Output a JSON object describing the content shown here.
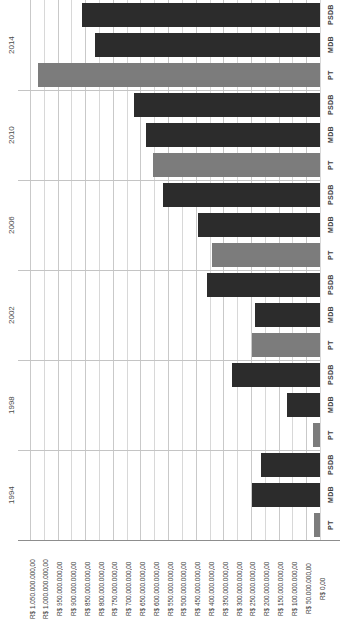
{
  "chart_data": {
    "type": "bar",
    "orientation": "horizontal",
    "title": "",
    "subtitle": "",
    "xlabel": "",
    "ylabel": "",
    "x_axis_reversed": true,
    "grid": true,
    "legend_position": "none",
    "xlim": [
      0,
      1050000000000
    ],
    "currency_prefix": "R$",
    "tick_labels": [
      "R$ 1.050.000.000,00",
      "R$ 1.000.000.000,00",
      "R$ 950.000.000,00",
      "R$ 900.000.000,00",
      "R$ 850.000.000,00",
      "R$ 800.000.000,00",
      "R$ 750.000.000,00",
      "R$ 700.000.000,00",
      "R$ 650.000.000,00",
      "R$ 600.000.000,00",
      "R$ 550.000.000,00",
      "R$ 500.000.000,00",
      "R$ 450.000.000,00",
      "R$ 400.000.000,00",
      "R$ 350.000.000,00",
      "R$ 300.000.000,00",
      "R$ 250.000.000,00",
      "R$ 200.000.000,00",
      "R$ 150.000.000,00",
      "R$ 100.000.000,00",
      "R$ 50.000.000,00",
      "R$ 0,00"
    ],
    "tick_values": [
      1050000000000,
      1000000000000,
      950000000000,
      900000000000,
      850000000000,
      800000000000,
      750000000000,
      700000000000,
      650000000000,
      600000000000,
      550000000000,
      500000000000,
      450000000000,
      400000000000,
      350000000000,
      300000000000,
      250000000000,
      200000000000,
      150000000000,
      100000000000,
      50000000000,
      0
    ],
    "years": [
      "2014",
      "2010",
      "2006",
      "2002",
      "1998",
      "1994"
    ],
    "parties": [
      "PSDB",
      "MDB",
      "PT"
    ],
    "colors": {
      "PSDB": "#2c2c2c",
      "MDB": "#2c2c2c",
      "PT": "#7c7c7c",
      "grid": "#d8d8d8",
      "axis": "#8d8d8d",
      "text": "#4a4a4a"
    },
    "bars": [
      {
        "year": "2014",
        "party": "PSDB",
        "value": 860000000000,
        "color": "#2c2c2c"
      },
      {
        "year": "2014",
        "party": "MDB",
        "value": 815000000000,
        "color": "#2c2c2c"
      },
      {
        "year": "2014",
        "party": "PT",
        "value": 1020000000000,
        "color": "#7c7c7c"
      },
      {
        "year": "2010",
        "party": "PSDB",
        "value": 675000000000,
        "color": "#2c2c2c"
      },
      {
        "year": "2010",
        "party": "MDB",
        "value": 630000000000,
        "color": "#2c2c2c"
      },
      {
        "year": "2010",
        "party": "PT",
        "value": 605000000000,
        "color": "#7c7c7c"
      },
      {
        "year": "2006",
        "party": "PSDB",
        "value": 570000000000,
        "color": "#2c2c2c"
      },
      {
        "year": "2006",
        "party": "MDB",
        "value": 440000000000,
        "color": "#2c2c2c"
      },
      {
        "year": "2006",
        "party": "PT",
        "value": 390000000000,
        "color": "#7c7c7c"
      },
      {
        "year": "2002",
        "party": "PSDB",
        "value": 410000000000,
        "color": "#2c2c2c"
      },
      {
        "year": "2002",
        "party": "MDB",
        "value": 235000000000,
        "color": "#2c2c2c"
      },
      {
        "year": "2002",
        "party": "PT",
        "value": 245000000000,
        "color": "#7c7c7c"
      },
      {
        "year": "1998",
        "party": "PSDB",
        "value": 320000000000,
        "color": "#2c2c2c"
      },
      {
        "year": "1998",
        "party": "MDB",
        "value": 120000000000,
        "color": "#2c2c2c"
      },
      {
        "year": "1998",
        "party": "PT",
        "value": 25000000000,
        "color": "#7c7c7c"
      },
      {
        "year": "1994",
        "party": "PSDB",
        "value": 215000000000,
        "color": "#2c2c2c"
      },
      {
        "year": "1994",
        "party": "MDB",
        "value": 245000000000,
        "color": "#2c2c2c"
      },
      {
        "year": "1994",
        "party": "PT",
        "value": 20000000000,
        "color": "#7c7c7c"
      }
    ]
  }
}
